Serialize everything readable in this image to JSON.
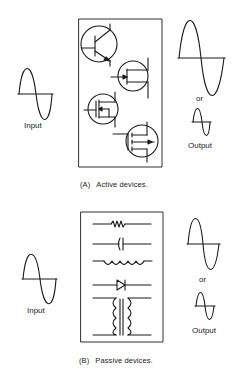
{
  "figure": {
    "panels": [
      {
        "id": "A",
        "input_label": "Input",
        "or_label": "or",
        "output_label": "Output",
        "caption_tag": "(A)",
        "caption_text": "Active devices.",
        "devices": [
          "bipolar-transistor",
          "jfet",
          "mosfet-depletion",
          "mosfet-enhancement"
        ]
      },
      {
        "id": "B",
        "input_label": "Input",
        "or_label": "or",
        "output_label": "Output",
        "caption_tag": "(B)",
        "caption_text": "Passive devices.",
        "devices": [
          "resistor",
          "capacitor",
          "inductor",
          "diode",
          "transformer"
        ]
      }
    ]
  }
}
